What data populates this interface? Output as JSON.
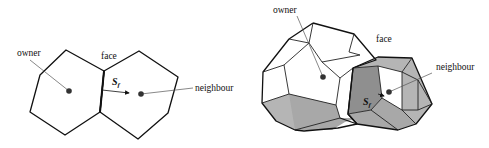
{
  "diagrams": [
    {
      "id": "2d",
      "labels": {
        "owner": "owner",
        "face": "face",
        "neighbour": "neighbour",
        "face_vector": "S",
        "face_vector_subscript": "f"
      }
    },
    {
      "id": "3d",
      "labels": {
        "owner": "owner",
        "face": "face",
        "neighbour": "neighbour",
        "face_vector": "S",
        "face_vector_subscript": "f"
      }
    }
  ],
  "colors": {
    "stroke": "#111111",
    "cell_center": "#333333",
    "shade_light": "#b5b5b5",
    "shade_dark": "#8f8f8f"
  }
}
